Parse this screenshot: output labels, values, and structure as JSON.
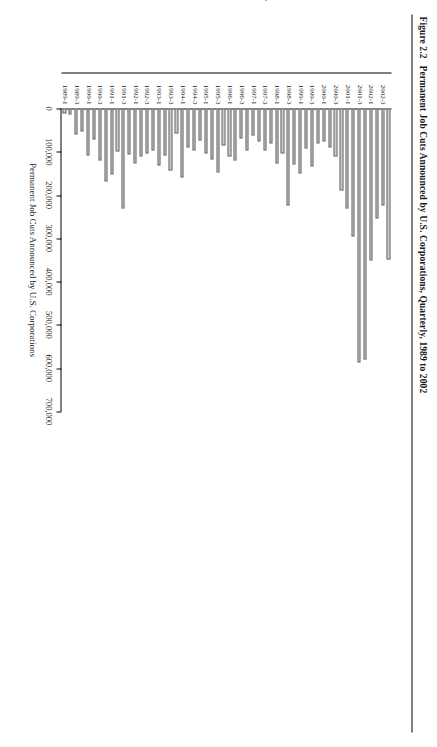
{
  "figure": {
    "number": "Figure 2.2",
    "title": "Permanent Job Cuts Announced by U.S. Corporations, Quarterly, 1989 to 2002"
  },
  "chart_data": {
    "type": "bar",
    "orientation": "horizontal",
    "title": "Permanent Job Cuts Announced by U.S. Corporations, Quarterly, 1989 to 2002",
    "xlabel": "Year and Quarter",
    "ylabel": "Permanent Job Cuts Announced by U.S. Corporations",
    "ylim": [
      0,
      700000
    ],
    "ytick_labels": [
      "0",
      "100,000",
      "200,000",
      "300,000",
      "400,000",
      "500,000",
      "600,000",
      "700,000"
    ],
    "ytick_values": [
      0,
      100000,
      200000,
      300000,
      400000,
      500000,
      600000,
      700000
    ],
    "grid": false,
    "legend": false,
    "bar_color": "#c9c9c9",
    "bar_edge_color": "#6f6f6f",
    "categories": [
      "1989-1",
      "1989-2",
      "1989-3",
      "1989-4",
      "1990-1",
      "1990-2",
      "1990-3",
      "1990-4",
      "1991-1",
      "1991-2",
      "1991-3",
      "1991-4",
      "1992-1",
      "1992-2",
      "1992-3",
      "1992-4",
      "1993-1",
      "1993-2",
      "1993-3",
      "1993-4",
      "1994-1",
      "1994-2",
      "1994-3",
      "1994-4",
      "1995-1",
      "1995-2",
      "1995-3",
      "1995-4",
      "1996-1",
      "1996-2",
      "1996-3",
      "1996-4",
      "1997-1",
      "1997-2",
      "1997-3",
      "1997-4",
      "1998-1",
      "1998-2",
      "1998-3",
      "1998-4",
      "1999-1",
      "1999-2",
      "1999-3",
      "1999-4",
      "2000-1",
      "2000-2",
      "2000-3",
      "2000-4",
      "2001-1",
      "2001-2",
      "2001-3",
      "2001-4",
      "2002-1",
      "2002-2",
      "2002-3",
      "2002-4"
    ],
    "tick_labeled_categories": [
      "1989-1",
      "1989-3",
      "1990-1",
      "1990-3",
      "1991-1",
      "1991-3",
      "1992-1",
      "1992-3",
      "1993-1",
      "1993-3",
      "1994-1",
      "1994-3",
      "1995-1",
      "1995-3",
      "1996-1",
      "1996-3",
      "1997-1",
      "1997-3",
      "1998-1",
      "1998-3",
      "1999-1",
      "1999-3",
      "2000-1",
      "2000-3",
      "2001-1",
      "2001-3",
      "2002-1",
      "2002-3"
    ],
    "values": [
      12000,
      14000,
      60000,
      52000,
      108000,
      72000,
      120000,
      168000,
      152000,
      100000,
      232000,
      106000,
      128000,
      112000,
      104000,
      96000,
      132000,
      108000,
      144000,
      58000,
      160000,
      90000,
      96000,
      74000,
      104000,
      118000,
      148000,
      86000,
      112000,
      120000,
      70000,
      98000,
      62000,
      76000,
      96000,
      80000,
      128000,
      104000,
      224000,
      130000,
      150000,
      92000,
      134000,
      80000,
      76000,
      90000,
      112000,
      190000,
      230000,
      296000,
      586000,
      580000,
      350000,
      254000,
      224000,
      348000
    ]
  }
}
